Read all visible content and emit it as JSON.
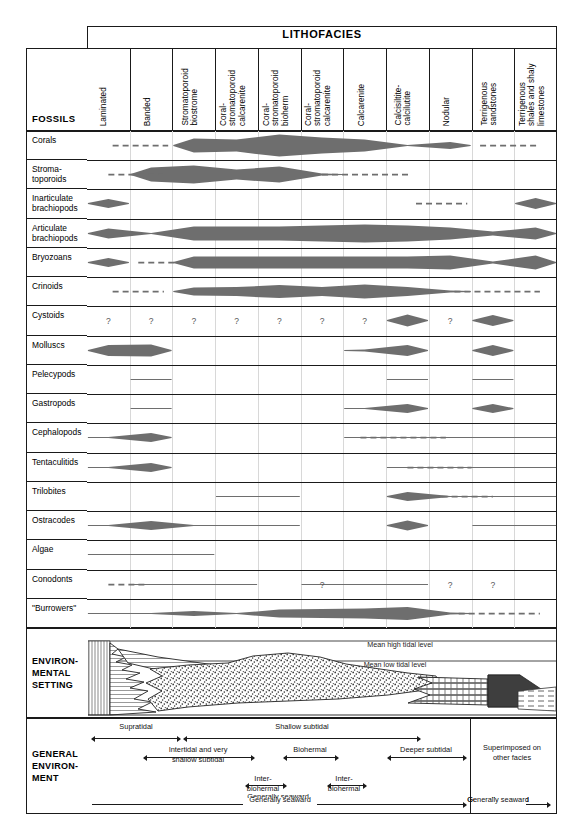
{
  "header": {
    "lithofacies_label": "LITHOFACIES",
    "fossils_label": "FOSSILS",
    "columns": [
      {
        "id": 1,
        "lines": [
          "Laminated"
        ]
      },
      {
        "id": 2,
        "lines": [
          "Banded"
        ]
      },
      {
        "id": 3,
        "lines": [
          "Stromatoporoid",
          "biostrome"
        ]
      },
      {
        "id": 4,
        "lines": [
          "Coral-",
          "stromatoporoid",
          "calcarenite"
        ]
      },
      {
        "id": 5,
        "lines": [
          "Coral-",
          "stromatoporoid",
          "bioherm"
        ]
      },
      {
        "id": 6,
        "lines": [
          "Coral-",
          "stromatoporoid",
          "calcarenite"
        ]
      },
      {
        "id": 7,
        "lines": [
          "Calcarenite"
        ]
      },
      {
        "id": 8,
        "lines": [
          "Calcisiltite-",
          "calcilutite"
        ]
      },
      {
        "id": 9,
        "lines": [
          "Nodular"
        ]
      },
      {
        "id": 10,
        "lines": [
          "Terrigenous",
          "sandstones"
        ]
      },
      {
        "id": 11,
        "lines": [
          "Terrigenous",
          "shales and shaly",
          "limestones"
        ]
      }
    ]
  },
  "fossil_rows": [
    {
      "label": "Corals",
      "lines": [
        "Corals"
      ]
    },
    {
      "label": "Stromatoporoids",
      "lines": [
        "Stroma-",
        "toporoids"
      ]
    },
    {
      "label": "Inarticulate brachiopods",
      "lines": [
        "Inarticulate",
        "brachiopods"
      ]
    },
    {
      "label": "Articulate brachiopods",
      "lines": [
        "Articulate",
        "brachiopods"
      ]
    },
    {
      "label": "Bryozoans",
      "lines": [
        "Bryozoans"
      ]
    },
    {
      "label": "Crinoids",
      "lines": [
        "Crinoids"
      ]
    },
    {
      "label": "Cystoids",
      "lines": [
        "Cystoids"
      ]
    },
    {
      "label": "Molluscs",
      "lines": [
        "Molluscs"
      ]
    },
    {
      "label": "Pelecypods",
      "lines": [
        "Pelecypods"
      ]
    },
    {
      "label": "Gastropods",
      "lines": [
        "Gastropods"
      ]
    },
    {
      "label": "Cephalopods",
      "lines": [
        "Cephalopods"
      ]
    },
    {
      "label": "Tentaculitids",
      "lines": [
        "Tentaculitids"
      ]
    },
    {
      "label": "Trilobites",
      "lines": [
        "Trilobites"
      ]
    },
    {
      "label": "Ostracodes",
      "lines": [
        "Ostracodes"
      ]
    },
    {
      "label": "Algae",
      "lines": [
        "Algae"
      ]
    },
    {
      "label": "Conodonts",
      "lines": [
        "Conodonts"
      ]
    },
    {
      "label": "\"Burrowers\"",
      "lines": [
        "\"Burrowers\""
      ]
    }
  ],
  "chart_data": {
    "type": "heatmap",
    "xlabel": "LITHOFACIES",
    "ylabel": "FOSSILS",
    "categories": [
      "Laminated",
      "Banded",
      "Stromatoporoid biostrome",
      "Coral-stromatoporoid calcarenite",
      "Coral-stromatoporoid bioherm",
      "Coral-stromatoporoid calcarenite",
      "Calcarenite",
      "Calcisiltite-calcilutite",
      "Nodular",
      "Terrigenous sandstones",
      "Terrigenous shales and shaly limestones"
    ],
    "encoding": "lens thickness = relative abundance; thin line = present/rare; dashed = uncertain/inferred; ? = questionable occurrence",
    "series": [
      {
        "name": "Corals",
        "values": [
          0,
          0,
          14,
          12,
          22,
          16,
          12,
          1,
          7,
          0,
          0
        ],
        "dashed_ranges": [
          [
            0.6,
            1.9
          ],
          [
            9.2,
            10.6
          ]
        ]
      },
      {
        "name": "Stromatoporoids",
        "values": [
          0,
          14,
          18,
          10,
          16,
          2,
          0,
          0,
          0,
          0,
          0
        ],
        "dashed_ranges": [
          [
            0.5,
            1.8
          ],
          [
            5.5,
            7.6
          ]
        ]
      },
      {
        "name": "Inarticulate brachiopods",
        "values": [
          9,
          0,
          0,
          0,
          0,
          0,
          0,
          0,
          0,
          0,
          11
        ],
        "dashed_ranges": [
          [
            7.7,
            8.9
          ]
        ]
      },
      {
        "name": "Articulate brachiopods",
        "values": [
          10,
          1,
          14,
          14,
          14,
          16,
          18,
          16,
          12,
          4,
          12
        ],
        "dashed_ranges": []
      },
      {
        "name": "Bryozoans",
        "values": [
          9,
          0,
          12,
          12,
          12,
          12,
          12,
          12,
          14,
          2,
          14
        ],
        "dashed_ranges": [
          [
            1.2,
            2.5
          ]
        ]
      },
      {
        "name": "Crinoids",
        "values": [
          0,
          0,
          8,
          9,
          13,
          9,
          14,
          9,
          2,
          0,
          0
        ],
        "dashed_ranges": [
          [
            0.6,
            1.8
          ],
          [
            8.6,
            10.6
          ]
        ]
      },
      {
        "name": "Cystoids",
        "values": [
          0,
          0,
          0,
          0,
          0,
          0,
          0,
          12,
          0,
          11,
          0
        ],
        "question_cols": [
          1,
          2,
          3,
          4,
          5,
          6,
          7,
          9
        ]
      },
      {
        "name": "Molluscs",
        "values": [
          11,
          12,
          0,
          0,
          0,
          0,
          2,
          11,
          0,
          11,
          0
        ],
        "dashed_ranges": []
      },
      {
        "name": "Pelecypods",
        "values": [
          0,
          1,
          0,
          0,
          0,
          0,
          0,
          1,
          0,
          1,
          0
        ],
        "dashed_ranges": []
      },
      {
        "name": "Gastropods",
        "values": [
          0,
          1,
          0,
          0,
          0,
          0,
          1,
          9,
          0,
          9,
          0
        ],
        "dashed_ranges": []
      },
      {
        "name": "Cephalopods",
        "values": [
          1,
          9,
          0,
          0,
          0,
          0,
          1,
          1,
          1,
          1,
          1
        ],
        "dashed_ranges": [
          [
            6.4,
            8.4
          ]
        ]
      },
      {
        "name": "Tentaculitids",
        "values": [
          1,
          9,
          0,
          0,
          0,
          0,
          0,
          1,
          1,
          1,
          1
        ],
        "dashed_ranges": [
          [
            7.5,
            9.0
          ]
        ]
      },
      {
        "name": "Trilobites",
        "values": [
          0,
          0,
          0,
          1,
          1,
          0,
          0,
          9,
          1,
          1,
          1
        ],
        "dashed_ranges": [
          [
            8.3,
            9.5
          ]
        ]
      },
      {
        "name": "Ostracodes",
        "values": [
          1,
          9,
          1,
          1,
          1,
          0,
          0,
          10,
          0,
          1,
          1
        ],
        "dashed_ranges": []
      },
      {
        "name": "Algae",
        "values": [
          1,
          1,
          1,
          0,
          0,
          0,
          0,
          0,
          0,
          0,
          0
        ],
        "dashed_ranges": []
      },
      {
        "name": "Conodonts",
        "values": [
          0,
          1,
          1,
          1,
          0,
          1,
          1,
          1,
          0,
          0,
          0
        ],
        "question_cols": [
          6,
          9,
          10
        ],
        "dashed_ranges": [
          [
            0.5,
            1.4
          ]
        ]
      },
      {
        "name": "\"Burrowers\"",
        "values": [
          1,
          1,
          5,
          1,
          8,
          9,
          10,
          13,
          2,
          0,
          0
        ],
        "dashed_ranges": [
          [
            8.7,
            10.6
          ]
        ]
      }
    ]
  },
  "environmental_setting": {
    "label_lines": [
      "ENVIRON-",
      "MENTAL",
      "SETTING"
    ],
    "tide_labels": [
      "Mean high tidal level",
      "Mean low tidal level"
    ],
    "facies_patterns": [
      "vertical-lined supratidal",
      "laminated / banded carbonate mud",
      "stippled carbonate sand",
      "brick nodular limestone",
      "solid terrigenous sandstone wedge",
      "dashed shale and shaly limestone"
    ]
  },
  "general_environment": {
    "label_lines": [
      "GENERAL",
      "ENVIRON-",
      "MENT"
    ],
    "zones": [
      {
        "name": "Supratidal"
      },
      {
        "name": "Shallow subtidal"
      },
      {
        "name": "Intertidal and very shallow subtidal",
        "line1": "Intertidal and very",
        "line2": "shallow subtidal"
      },
      {
        "name": "Biohermal"
      },
      {
        "name": "Deeper subtidal"
      },
      {
        "name": "Inter-biohermal",
        "line1": "Inter-",
        "line2": "biohermal"
      },
      {
        "name": "Inter-biohermal",
        "line1": "Inter-",
        "line2": "biohermal"
      },
      {
        "name": "Generally seaward"
      },
      {
        "name": "Generally seaward"
      },
      {
        "name": "Superimposed on other facies",
        "line1": "Superimposed on",
        "line2": "other facies"
      }
    ]
  },
  "colors": {
    "ink": "#1a1a1a",
    "lens_fill": "#6e6e6e",
    "grid": "#d8d8d8",
    "paper": "#ffffff"
  }
}
